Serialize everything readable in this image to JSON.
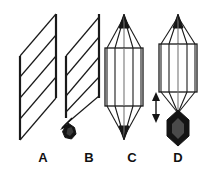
{
  "figure": {
    "background_color": "#ffffff",
    "stroke_color": "#1a1a1a",
    "fill_dark": "#141414",
    "panel_count": 4
  },
  "labels": {
    "a": "A",
    "b": "B",
    "c": "C",
    "d": "D"
  },
  "panels": [
    {
      "id": "A",
      "label": "A",
      "type": "sheared-array",
      "description": "Two offset vertical poles joined by five parallel diagonal fibers forming a parallelogram",
      "pole_count": 2,
      "fiber_count": 5,
      "has_chromosome": false,
      "has_arrow": false
    },
    {
      "id": "B",
      "label": "B",
      "type": "sheared-array-with-chromosome",
      "description": "Same sheared array as A with a diagonal arrow pointing down-left to a dark chromosome body",
      "pole_count": 2,
      "fiber_count": 5,
      "has_chromosome": true,
      "has_arrow": true,
      "arrow_kind": "single-headed-diagonal",
      "arrow_direction": "down-left"
    },
    {
      "id": "C",
      "label": "C",
      "type": "bipolar-spindle",
      "description": "Bipolar spindle with filled arrowhead poles top and bottom and a tall rectangular chromosome plate crossed by five fibers",
      "pole_count": 2,
      "fiber_count": 5,
      "box_height_units": 54,
      "has_chromosome": false,
      "has_arrow": false
    },
    {
      "id": "D",
      "label": "D",
      "type": "bipolar-spindle-shortened",
      "description": "Bipolar spindle with a shorter rectangular plate, a double-headed vertical measurement arrow at left, and a dark chromosome body beneath the lower pole",
      "pole_count": 2,
      "fiber_count": 5,
      "box_height_units": 44,
      "has_chromosome": true,
      "has_arrow": true,
      "arrow_kind": "double-headed-vertical",
      "arrow_direction": "up-down"
    }
  ]
}
